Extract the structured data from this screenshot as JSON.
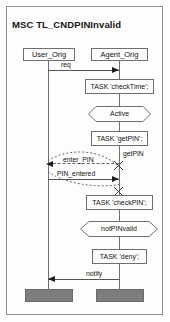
{
  "diagram": {
    "type": "message-sequence-chart",
    "title": "MSC TL_CNDPINInvalid",
    "instances": [
      {
        "id": "user",
        "name": "User_Orig"
      },
      {
        "id": "agent",
        "name": "Agent_Orig"
      }
    ],
    "actions": [
      {
        "id": "checktime",
        "label": "TASK 'checkTime';",
        "instance": "agent"
      },
      {
        "id": "getpin",
        "label": "TASK 'getPIN';",
        "instance": "agent"
      },
      {
        "id": "checkpin",
        "label": "TASK 'checkPIN';",
        "instance": "agent"
      },
      {
        "id": "deny",
        "label": "TASK 'deny';",
        "instance": "agent"
      }
    ],
    "conditions": [
      {
        "id": "active",
        "label": "Active",
        "instance": "agent"
      },
      {
        "id": "notpinvalid",
        "label": "notPINvalid",
        "instance": "agent"
      }
    ],
    "messages": [
      {
        "id": "req",
        "label": "req",
        "from": "user",
        "to": "agent",
        "direction": "right",
        "style": "solid"
      },
      {
        "id": "getpin",
        "label": "getPIN",
        "from": "agent",
        "to": "user",
        "direction": "left",
        "style": "dashed"
      },
      {
        "id": "enter_pin",
        "label": "enter_PIN",
        "from": "agent",
        "to": "user",
        "direction": "left",
        "style": "dashed"
      },
      {
        "id": "pin_entered",
        "label": "PIN_entered",
        "from": "user",
        "to": "agent",
        "direction": "right",
        "style": "solid"
      },
      {
        "id": "notify",
        "label": "notify",
        "from": "agent",
        "to": "user",
        "direction": "left",
        "style": "solid"
      }
    ],
    "colors": {
      "background": "#fdfdfd",
      "frame_border": "#8d8d8d",
      "line": "#6f6f6f",
      "arrow": "#1d1d1d",
      "terminator_fill": "#7d7d7d",
      "text": "#141414"
    }
  }
}
